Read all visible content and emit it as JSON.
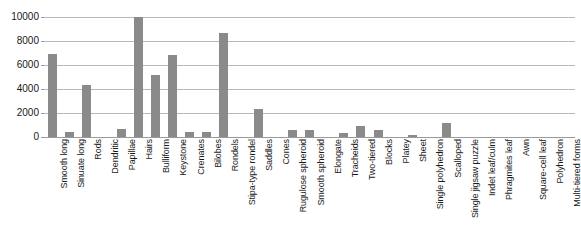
{
  "chart_data": {
    "type": "bar",
    "title": "",
    "subtitle": "",
    "xlabel": "",
    "ylabel": "",
    "ylim": [
      0,
      10000
    ],
    "yticks": [
      0,
      2000,
      4000,
      6000,
      8000,
      10000
    ],
    "ytick_labels": [
      "0",
      "2000",
      "4000",
      "6000",
      "8000",
      "10000"
    ],
    "grid": true,
    "legend": false,
    "legend_position": "none",
    "bar_color": "#8a8a8a",
    "gridline_color": "#b8b8b8",
    "axis_color": "#9a9a9a",
    "categories": [
      "Smooth long",
      "Sinuate long",
      "Rods",
      "Dendritic",
      "Papillae",
      "Hairs",
      "Bulliform",
      "Keystone",
      "Crenates",
      "Bilobes",
      "Rondels",
      "Stipa-type rondel",
      "Saddles",
      "Cones",
      "Rugulose spheroid",
      "Smooth spheroid",
      "Elongate",
      "Tracheids",
      "Two-tiered",
      "Blocks",
      "Platey",
      "Sheet",
      "Single polyhedron",
      "Scalloped",
      "Single jigsaw puzzle",
      "Indet leaf/culm",
      "Phragmites leaf",
      "Awn",
      "Square-cell leaf",
      "Polyhedron",
      "Multi-tiered forms"
    ],
    "values": [
      6950,
      400,
      4300,
      0,
      700,
      10000,
      5200,
      6800,
      430,
      430,
      8700,
      0,
      2300,
      0,
      620,
      620,
      0,
      300,
      900,
      620,
      0,
      180,
      0,
      1150,
      0,
      0,
      0,
      0,
      0,
      0,
      0
    ]
  }
}
